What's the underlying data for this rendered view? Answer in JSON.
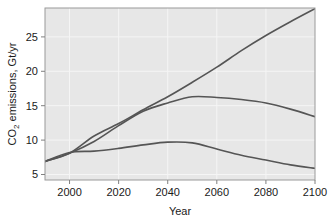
{
  "chart_data": {
    "type": "line",
    "title": "",
    "xlabel": "Year",
    "ylabel": "CO2 emissions, Gt/yr",
    "ylabel_main": "CO",
    "ylabel_sub": "2",
    "ylabel_rest": " emissions, Gt/yr",
    "xlim": [
      1990,
      2100
    ],
    "ylim": [
      4.2,
      29.2
    ],
    "grid": true,
    "legend": "none",
    "xticks": [
      2000,
      2020,
      2040,
      2060,
      2080,
      2100
    ],
    "xtick_labels": [
      "2000",
      "2020",
      "2040",
      "2060",
      "2080",
      "2100"
    ],
    "yticks": [
      5,
      10,
      15,
      20,
      25
    ],
    "ytick_labels": [
      "5",
      "10",
      "15",
      "20",
      "25"
    ],
    "x": [
      1990,
      2000,
      2010,
      2020,
      2030,
      2040,
      2050,
      2060,
      2070,
      2080,
      2090,
      2100
    ],
    "series": [
      {
        "name": "high-growth",
        "values": [
          6.9,
          8.1,
          10.6,
          12.4,
          14.4,
          16.3,
          18.4,
          20.6,
          23.0,
          25.2,
          27.2,
          29.1
        ]
      },
      {
        "name": "stabilizing",
        "values": [
          6.9,
          8.1,
          9.8,
          12.1,
          14.2,
          15.4,
          16.3,
          16.2,
          15.9,
          15.4,
          14.5,
          13.4
        ]
      },
      {
        "name": "declining",
        "values": [
          6.9,
          8.2,
          8.4,
          8.8,
          9.3,
          9.7,
          9.6,
          8.7,
          7.8,
          7.1,
          6.4,
          5.9
        ]
      }
    ],
    "colors": {
      "line": "#555555",
      "plot_background": "#e7e7e7",
      "grid": "#f5f5f5",
      "axis": "#808080",
      "page_background": "#ffffff"
    }
  }
}
